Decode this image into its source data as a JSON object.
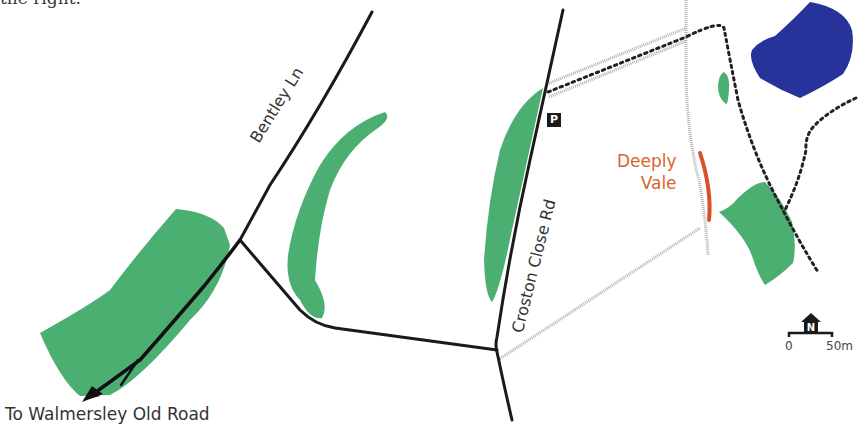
{
  "header": {
    "clipped_text": "the right."
  },
  "roads": {
    "bentley_ln": "Bentley Ln",
    "croston_close_rd": "Croston Close Rd"
  },
  "places": {
    "deeply_vale_line1": "Deeply",
    "deeply_vale_line2": "Vale"
  },
  "directions": {
    "to_walmersley": "To Walmersley Old Road"
  },
  "parking": {
    "label": "P"
  },
  "scale": {
    "start": "0",
    "end": "50m",
    "north": "N"
  },
  "colors": {
    "woodland": "#4caf72",
    "water": "#27329a",
    "road": "#1a1a1a",
    "track": "#b8b8b8",
    "footpath": "#222222",
    "highlight": "#d9502a"
  }
}
